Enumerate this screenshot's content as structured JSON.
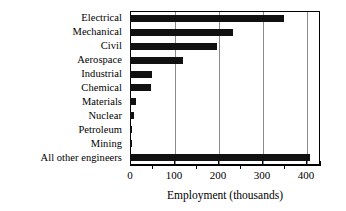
{
  "chart_data": {
    "type": "bar",
    "orientation": "horizontal",
    "title": "",
    "subtitle": "",
    "xlabel": "Employment (thousands)",
    "ylabel": "",
    "categories": [
      "Electrical",
      "Mechanical",
      "Civil",
      "Aerospace",
      "Industrial",
      "Chemical",
      "Materials",
      "Nuclear",
      "Petroleum",
      "Mining",
      "All other engineers"
    ],
    "values": [
      350,
      235,
      197,
      120,
      50,
      48,
      14,
      8,
      5,
      5,
      410
    ],
    "xlim": [
      0,
      432
    ],
    "ylim": [
      0,
      11
    ],
    "xticks": [
      0,
      100,
      200,
      300,
      400
    ],
    "xticklabels": [
      "0",
      "100",
      "200",
      "300",
      "400"
    ],
    "xminorticks": [
      50,
      150,
      250,
      350
    ],
    "grid": true,
    "grid_axis": "x",
    "legend": false,
    "legend_position": "none",
    "bar_color": "#111111",
    "gridline_color": "#8a8a8a",
    "axis_color": "#000000",
    "background_color": "#ffffff"
  }
}
